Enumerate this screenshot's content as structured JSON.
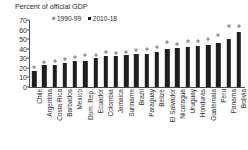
{
  "chart_data": {
    "type": "bar",
    "title": "Percent of official GDP",
    "xlabel": "",
    "ylabel": "Percent of official GDP",
    "ylim": [
      0,
      70
    ],
    "yticks": [
      0,
      10,
      20,
      30,
      40,
      50,
      60,
      70
    ],
    "grid": false,
    "legend_position": "top-left",
    "categories": [
      "Chile",
      "Argentina",
      "Costa Rica",
      "Barbados",
      "Mexico",
      "Dom. Rep.",
      "Ecuador",
      "Colombia",
      "Jamaica",
      "Suriname",
      "Brazil",
      "Paraguay",
      "Belize",
      "El Salvador",
      "Nicaragua",
      "Uruguay",
      "Honduras",
      "Guatemala",
      "Peru",
      "Panama",
      "Bolivia"
    ],
    "series": [
      {
        "name": "2010-18",
        "type": "bar",
        "color": "#1f1f1f",
        "marker": "square",
        "values": [
          17,
          23,
          23,
          25,
          27,
          27,
          30,
          32,
          32,
          33,
          34,
          35,
          37,
          40,
          41,
          42,
          43,
          44,
          46,
          50,
          57
        ]
      },
      {
        "name": "1990-99",
        "type": "scatter",
        "color": "#9a9a9a",
        "marker": "diamond",
        "values": [
          21,
          26,
          27,
          29,
          31,
          33,
          33,
          36,
          35,
          36,
          38,
          39,
          42,
          47,
          45,
          48,
          48,
          50,
          54,
          64,
          64
        ]
      }
    ]
  },
  "legend": {
    "entries": [
      {
        "label": "1990-99",
        "marker": "diamond",
        "color": "#8e8e8e"
      },
      {
        "label": "2010-18",
        "marker": "square",
        "color": "#1a1a1a"
      }
    ]
  }
}
